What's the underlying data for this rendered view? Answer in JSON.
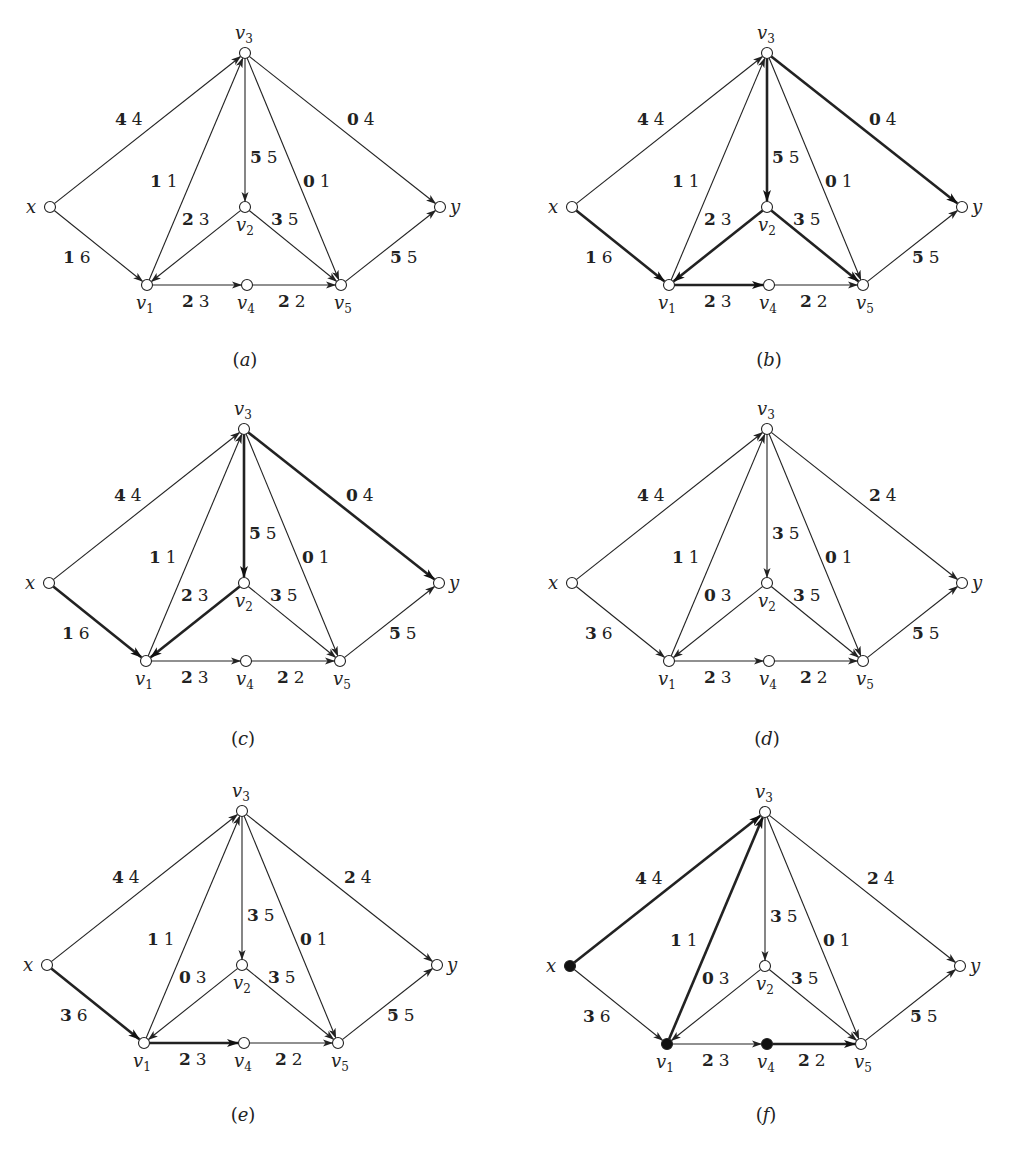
{
  "figure": {
    "node_offsets": {
      "x": [
        -195,
        154
      ],
      "v3": [
        0,
        0
      ],
      "v2": [
        0,
        154
      ],
      "y": [
        195,
        154
      ],
      "v1": [
        -98,
        232
      ],
      "v4": [
        2,
        232
      ],
      "v5": [
        96,
        232
      ]
    },
    "node_labels": {
      "x": {
        "base": "x",
        "sub": "",
        "dx": -24,
        "dy": 6
      },
      "v3": {
        "base": "v",
        "sub": "3",
        "dx": -10,
        "dy": -14
      },
      "v2": {
        "base": "v",
        "sub": "2",
        "dx": -9,
        "dy": 24
      },
      "y": {
        "base": "y",
        "sub": "",
        "dx": 10,
        "dy": 6
      },
      "v1": {
        "base": "v",
        "sub": "1",
        "dx": -11,
        "dy": 24
      },
      "v4": {
        "base": "v",
        "sub": "4",
        "dx": -10,
        "dy": 24
      },
      "v5": {
        "base": "v",
        "sub": "5",
        "dx": -7,
        "dy": 24
      }
    },
    "edges": [
      {
        "id": "x-v3",
        "from": "x",
        "to": "v3",
        "label_pos": [
          -130,
          72
        ]
      },
      {
        "id": "x-v1",
        "from": "x",
        "to": "v1",
        "label_pos": [
          -182,
          210
        ]
      },
      {
        "id": "v1-v3",
        "from": "v1",
        "to": "v3",
        "label_pos": [
          -95,
          134
        ]
      },
      {
        "id": "v3-v2",
        "from": "v3",
        "to": "v2",
        "label_pos": [
          5,
          110
        ]
      },
      {
        "id": "v3-v5",
        "from": "v3",
        "to": "v5",
        "label_pos": [
          58,
          134
        ]
      },
      {
        "id": "v3-y",
        "from": "v3",
        "to": "y",
        "label_pos": [
          102,
          72
        ]
      },
      {
        "id": "v2-v1",
        "from": "v2",
        "to": "v1",
        "label_pos": [
          -63,
          172
        ]
      },
      {
        "id": "v2-v5",
        "from": "v2",
        "to": "v5",
        "label_pos": [
          26,
          172
        ]
      },
      {
        "id": "v1-v4",
        "from": "v1",
        "to": "v4",
        "label_pos": [
          -63,
          254
        ]
      },
      {
        "id": "v4-v5",
        "from": "v4",
        "to": "v5",
        "label_pos": [
          33,
          254
        ]
      },
      {
        "id": "v5-y",
        "from": "v5",
        "to": "y",
        "label_pos": [
          145,
          210
        ]
      }
    ],
    "panels": [
      {
        "id": "a",
        "caption": "a",
        "origin": [
          245,
          53
        ],
        "caption_pos": [
          245,
          366
        ],
        "flows": {
          "x-v3": [
            4,
            4
          ],
          "x-v1": [
            1,
            6
          ],
          "v1-v3": [
            1,
            1
          ],
          "v3-v2": [
            5,
            5
          ],
          "v3-v5": [
            0,
            1
          ],
          "v3-y": [
            0,
            4
          ],
          "v2-v1": [
            2,
            3
          ],
          "v2-v5": [
            3,
            5
          ],
          "v1-v4": [
            2,
            3
          ],
          "v4-v5": [
            2,
            2
          ],
          "v5-y": [
            5,
            5
          ]
        },
        "bold_edges": [],
        "filled_nodes": []
      },
      {
        "id": "b",
        "caption": "b",
        "origin": [
          767,
          53
        ],
        "caption_pos": [
          769,
          366
        ],
        "flows": {
          "x-v3": [
            4,
            4
          ],
          "x-v1": [
            1,
            6
          ],
          "v1-v3": [
            1,
            1
          ],
          "v3-v2": [
            5,
            5
          ],
          "v3-v5": [
            0,
            1
          ],
          "v3-y": [
            0,
            4
          ],
          "v2-v1": [
            2,
            3
          ],
          "v2-v5": [
            3,
            5
          ],
          "v1-v4": [
            2,
            3
          ],
          "v4-v5": [
            2,
            2
          ],
          "v5-y": [
            5,
            5
          ]
        },
        "bold_edges": [
          "x-v1",
          "v3-y",
          "v3-v2",
          "v2-v1",
          "v2-v5",
          "v1-v4"
        ],
        "filled_nodes": []
      },
      {
        "id": "c",
        "caption": "c",
        "origin": [
          244,
          429
        ],
        "caption_pos": [
          243,
          745
        ],
        "flows": {
          "x-v3": [
            4,
            4
          ],
          "x-v1": [
            1,
            6
          ],
          "v1-v3": [
            1,
            1
          ],
          "v3-v2": [
            5,
            5
          ],
          "v3-v5": [
            0,
            1
          ],
          "v3-y": [
            0,
            4
          ],
          "v2-v1": [
            2,
            3
          ],
          "v2-v5": [
            3,
            5
          ],
          "v1-v4": [
            2,
            3
          ],
          "v4-v5": [
            2,
            2
          ],
          "v5-y": [
            5,
            5
          ]
        },
        "bold_edges": [
          "x-v1",
          "v2-v1",
          "v3-v2",
          "v3-y"
        ],
        "filled_nodes": []
      },
      {
        "id": "d",
        "caption": "d",
        "origin": [
          767,
          429
        ],
        "caption_pos": [
          767,
          745
        ],
        "flows": {
          "x-v3": [
            4,
            4
          ],
          "x-v1": [
            3,
            6
          ],
          "v1-v3": [
            1,
            1
          ],
          "v3-v2": [
            3,
            5
          ],
          "v3-v5": [
            0,
            1
          ],
          "v3-y": [
            2,
            4
          ],
          "v2-v1": [
            0,
            3
          ],
          "v2-v5": [
            3,
            5
          ],
          "v1-v4": [
            2,
            3
          ],
          "v4-v5": [
            2,
            2
          ],
          "v5-y": [
            5,
            5
          ]
        },
        "bold_edges": [],
        "filled_nodes": []
      },
      {
        "id": "e",
        "caption": "e",
        "origin": [
          242,
          811
        ],
        "caption_pos": [
          243,
          1121
        ],
        "flows": {
          "x-v3": [
            4,
            4
          ],
          "x-v1": [
            3,
            6
          ],
          "v1-v3": [
            1,
            1
          ],
          "v3-v2": [
            3,
            5
          ],
          "v3-v5": [
            0,
            1
          ],
          "v3-y": [
            2,
            4
          ],
          "v2-v1": [
            0,
            3
          ],
          "v2-v5": [
            3,
            5
          ],
          "v1-v4": [
            2,
            3
          ],
          "v4-v5": [
            2,
            2
          ],
          "v5-y": [
            5,
            5
          ]
        },
        "bold_edges": [
          "x-v1",
          "v1-v4"
        ],
        "filled_nodes": []
      },
      {
        "id": "f",
        "caption": "f",
        "origin": [
          765,
          812
        ],
        "caption_pos": [
          766,
          1121
        ],
        "flows": {
          "x-v3": [
            4,
            4
          ],
          "x-v1": [
            3,
            6
          ],
          "v1-v3": [
            1,
            1
          ],
          "v3-v2": [
            3,
            5
          ],
          "v3-v5": [
            0,
            1
          ],
          "v3-y": [
            2,
            4
          ],
          "v2-v1": [
            0,
            3
          ],
          "v2-v5": [
            3,
            5
          ],
          "v1-v4": [
            2,
            3
          ],
          "v4-v5": [
            2,
            2
          ],
          "v5-y": [
            5,
            5
          ]
        },
        "bold_edges": [
          "x-v3",
          "v1-v3",
          "v4-v5"
        ],
        "filled_nodes": [
          "x",
          "v1",
          "v4"
        ]
      }
    ]
  }
}
